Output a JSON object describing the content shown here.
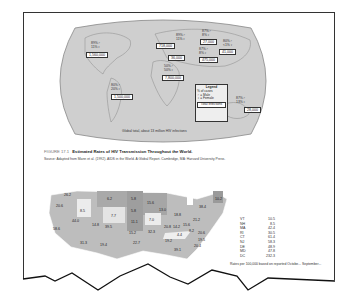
{
  "world_map": {
    "regions": [
      {
        "name": "North America",
        "male": "89%",
        "female": "11%",
        "total": "1,560,000"
      },
      {
        "name": "Western Europe",
        "male": "89%",
        "female": "11%",
        "total": "718,000"
      },
      {
        "name": "Eastern Europe",
        "total": "36,000"
      },
      {
        "name": "East Asia",
        "male": "87%",
        "female": "8%",
        "total": "27,000"
      },
      {
        "name": "Japan/Pacific",
        "male": "80%",
        "female": "<1%",
        "total": "41,000"
      },
      {
        "name": "South Asia",
        "male": "87%",
        "female": "8%",
        "total": "475,000"
      },
      {
        "name": "Africa",
        "male": "50%",
        "female": "50%",
        "total": "7,800,000"
      },
      {
        "name": "Latin America",
        "male": "80%",
        "female": "20%",
        "total": "1,500,000"
      },
      {
        "name": "Australia",
        "male": "87%",
        "female": "13%",
        "total": "28,000"
      }
    ],
    "legend": {
      "title": "Legend",
      "subtitle": "% of cases",
      "male": "♂ = Male",
      "female": "♀ = Female",
      "total": "Total Infections"
    },
    "global_note": "Global total, about 13 million HIV infections"
  },
  "caption": {
    "figure_number": "FIGURE 17.1",
    "title": "Estimated Rates of HIV Transmission Throughout the World.",
    "source": "Source: Adapted from Mann et al. (1992). AIDS in the World. A Global Report. Cambridge, MA: Harvard University Press."
  },
  "us_map": {
    "states": [
      {
        "label": "26.2",
        "x": 17,
        "y": 4
      },
      {
        "label": "20.6",
        "x": 9,
        "y": 15
      },
      {
        "label": "8.5",
        "x": 36,
        "y": 21
      },
      {
        "label": "6.2",
        "x": 61,
        "y": 9
      },
      {
        "label": "5.8",
        "x": 85,
        "y": 9
      },
      {
        "label": "7.7",
        "x": 67,
        "y": 26
      },
      {
        "label": "5.8",
        "x": 86,
        "y": 21
      },
      {
        "label": "15.6",
        "x": 104,
        "y": 13
      },
      {
        "label": "13.0",
        "x": 115,
        "y": 21
      },
      {
        "label": "44.0",
        "x": 27,
        "y": 31
      },
      {
        "label": "14.8",
        "x": 48,
        "y": 35
      },
      {
        "label": "11.1",
        "x": 87,
        "y": 32
      },
      {
        "label": "7.0",
        "x": 106,
        "y": 30
      },
      {
        "label": "18.8",
        "x": 130,
        "y": 26
      },
      {
        "label": "58.6",
        "x": 8,
        "y": 39
      },
      {
        "label": "39.5",
        "x": 61,
        "y": 37
      },
      {
        "label": "15.2",
        "x": 85,
        "y": 43
      },
      {
        "label": "32.3",
        "x": 104,
        "y": 42
      },
      {
        "label": "20.8",
        "x": 121,
        "y": 37
      },
      {
        "label": "14.2",
        "x": 130,
        "y": 37
      },
      {
        "label": "15.6",
        "x": 139,
        "y": 35
      },
      {
        "label": "21.2",
        "x": 149,
        "y": 30
      },
      {
        "label": "38.4",
        "x": 155,
        "y": 17
      },
      {
        "label": "4.4",
        "x": 134,
        "y": 45
      },
      {
        "label": "8.2",
        "x": 145,
        "y": 41
      },
      {
        "label": "20.6",
        "x": 155,
        "y": 43
      },
      {
        "label": "31.3",
        "x": 36,
        "y": 53
      },
      {
        "label": "19.4",
        "x": 56,
        "y": 55
      },
      {
        "label": "22.7",
        "x": 89,
        "y": 53
      },
      {
        "label": "19.2",
        "x": 121,
        "y": 51
      },
      {
        "label": "19.5",
        "x": 154,
        "y": 50
      },
      {
        "label": "20.4",
        "x": 150,
        "y": 56
      },
      {
        "label": "39.1",
        "x": 130,
        "y": 60
      },
      {
        "label": "10.2",
        "x": 172,
        "y": 9
      }
    ],
    "side_table": [
      {
        "state": "VT",
        "value": "10.5"
      },
      {
        "state": "NH",
        "value": "8.5"
      },
      {
        "state": "MA",
        "value": "42.4"
      },
      {
        "state": "RI",
        "value": "30.5"
      },
      {
        "state": "CT",
        "value": "61.4"
      },
      {
        "state": "NJ",
        "value": "58.3"
      },
      {
        "state": "DE",
        "value": "48.9"
      },
      {
        "state": "MD",
        "value": "47.8"
      },
      {
        "state": "DC",
        "value": "232.3"
      }
    ],
    "footnote": "Rates per 100,000 based on reported Octobe... September..."
  }
}
